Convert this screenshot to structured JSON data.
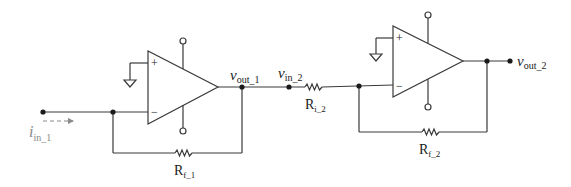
{
  "diagram": {
    "type": "circuit-schematic",
    "colors": {
      "wire": "#3a3a3a",
      "text": "#1a1a1a",
      "current_arrow": "#8a8a8a"
    },
    "labels": {
      "i_in_1": {
        "main": "i",
        "sub": "in_1"
      },
      "v_out_1": {
        "main": "v",
        "sub": "out_1"
      },
      "v_in_2": {
        "main": "v",
        "sub": "in_2"
      },
      "v_out_2": {
        "main": "v",
        "sub": "out_2"
      },
      "R_f_1": {
        "main": "R",
        "sub": "f_1"
      },
      "R_i_2": {
        "main": "R",
        "sub": "i_2"
      },
      "R_f_2": {
        "main": "R",
        "sub": "f_2"
      }
    },
    "opamps": [
      {
        "id": "opamp-1",
        "plus": "+",
        "minus": "−"
      },
      {
        "id": "opamp-2",
        "plus": "+",
        "minus": "−"
      }
    ]
  }
}
